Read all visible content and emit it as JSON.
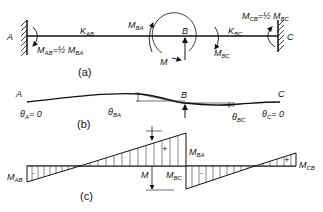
{
  "figure": {
    "panel_a": {
      "caption": "(a)",
      "support_left": "A",
      "support_right": "C",
      "joint": "B",
      "stiffness_ab": {
        "main": "K",
        "sub": "AB"
      },
      "stiffness_bc": {
        "main": "K",
        "sub": "BC"
      },
      "moment_ba": {
        "main": "M",
        "sub": "BA"
      },
      "moment_bc": {
        "main": "M",
        "sub": "BC"
      },
      "moment_ab": {
        "main": "M",
        "sub": "AB",
        "eq": "=½ M",
        "eq_sub": "BA"
      },
      "moment_cb": {
        "main": "M",
        "sub": "CB",
        "eq": "=½ M",
        "eq_sub": "BC"
      },
      "applied_moment": "M"
    },
    "panel_b": {
      "caption": "(b)",
      "left_label": "A",
      "right_label": "C",
      "joint": "B",
      "theta_a": {
        "main": "θ",
        "sub": "A",
        "eq": "= 0"
      },
      "theta_c": {
        "main": "θ",
        "sub": "C",
        "eq": "= 0"
      },
      "theta_ba": {
        "main": "θ",
        "sub": "BA"
      },
      "theta_bc": {
        "main": "θ",
        "sub": "BC"
      }
    },
    "panel_c": {
      "caption": "(c)",
      "m_ab": {
        "main": "M",
        "sub": "AB"
      },
      "m_ba": {
        "main": "M",
        "sub": "BA"
      },
      "m_bc": {
        "main": "M",
        "sub": "BC"
      },
      "m_cb": {
        "main": "M",
        "sub": "CB"
      },
      "m_total": "M",
      "signs": [
        "-",
        "+",
        "-",
        "+"
      ]
    }
  }
}
